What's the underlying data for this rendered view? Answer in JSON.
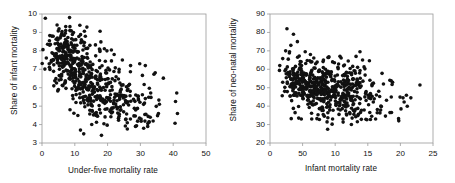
{
  "figure": {
    "background": "#ffffff",
    "point_color": "#111111",
    "axis_color": "#9a9a9a",
    "text_color": "#111111"
  },
  "chart_data": [
    {
      "id": "left",
      "type": "scatter",
      "title": "",
      "xlabel": "Under-five mortality rate",
      "ylabel": "Share of infant mortality",
      "xlim": [
        0,
        50
      ],
      "ylim": [
        3,
        10
      ],
      "xticks": [
        0,
        10,
        20,
        30,
        40,
        50
      ],
      "xticklabels": [
        "0",
        "10",
        "20",
        "30",
        "40",
        "50"
      ],
      "yticks": [
        3,
        4,
        5,
        6,
        7,
        8,
        9,
        10
      ],
      "yticklabels": [
        "3",
        "4",
        "5",
        "6",
        "7",
        "8",
        "9",
        "10"
      ],
      "grid": false,
      "legend": null,
      "marker": {
        "shape": "circle",
        "size_px": 1.8,
        "color": "#111111"
      },
      "n_points": 560,
      "description": "Dense negatively-sloped cloud: share of infant mortality falls from about 9 at low under-five mortality rates to about 4 near rates of 30-35, with scattered outliers out to 41.",
      "generator": {
        "method": "deterministic-lcg",
        "seed": 20240517,
        "clusters": [
          {
            "n": 150,
            "x_mean": 6.5,
            "x_sd": 2.6,
            "y_mean": 7.9,
            "y_sd": 0.75
          },
          {
            "n": 150,
            "x_mean": 11.5,
            "x_sd": 3.6,
            "y_mean": 6.9,
            "y_sd": 0.85
          },
          {
            "n": 130,
            "x_mean": 17.0,
            "x_sd": 4.2,
            "y_mean": 5.9,
            "y_sd": 0.8
          },
          {
            "n": 90,
            "x_mean": 23.0,
            "x_sd": 4.5,
            "y_mean": 5.3,
            "y_sd": 0.75
          },
          {
            "n": 30,
            "x_mean": 30.5,
            "x_sd": 3.2,
            "y_mean": 4.6,
            "y_sd": 0.6
          },
          {
            "n": 10,
            "x_mean": 35.0,
            "x_sd": 3.0,
            "y_mean": 5.2,
            "y_sd": 0.9
          }
        ],
        "outliers": [
          [
            2.2,
            7.3
          ],
          [
            4.6,
            9.4
          ],
          [
            5.2,
            9.2
          ],
          [
            8.5,
            9.1
          ],
          [
            9.6,
            9.0
          ],
          [
            12.0,
            8.6
          ],
          [
            14.6,
            8.3
          ],
          [
            17.5,
            8.1
          ],
          [
            19.8,
            8.0
          ],
          [
            22.0,
            7.8
          ],
          [
            24.5,
            7.5
          ],
          [
            27.0,
            7.2
          ],
          [
            29.8,
            7.3
          ],
          [
            31.5,
            7.2
          ],
          [
            26.0,
            4.1
          ],
          [
            28.5,
            3.9
          ],
          [
            30.2,
            4.3
          ],
          [
            31.0,
            3.8
          ],
          [
            33.0,
            4.4
          ],
          [
            35.5,
            4.6
          ],
          [
            35.8,
            5.1
          ],
          [
            41.3,
            4.6
          ],
          [
            3.0,
            8.8
          ],
          [
            3.6,
            6.1
          ],
          [
            5.0,
            5.9
          ]
        ]
      }
    },
    {
      "id": "right",
      "type": "scatter",
      "title": "",
      "xlabel": "Infant mortality rate",
      "ylabel": "Share of neo-natal mortality",
      "xlim": [
        0,
        25
      ],
      "ylim": [
        20,
        90
      ],
      "xticks": [
        0,
        5,
        10,
        15,
        20,
        25
      ],
      "xticklabels": [
        "0",
        "50",
        "10",
        "15",
        "20",
        "25"
      ],
      "yticks": [
        20,
        30,
        40,
        50,
        60,
        70,
        80,
        90
      ],
      "yticklabels": [
        "20",
        "30",
        "40",
        "50",
        "60",
        "70",
        "80",
        "90"
      ],
      "grid": false,
      "legend": null,
      "marker": {
        "shape": "circle",
        "size_px": 1.8,
        "color": "#111111"
      },
      "n_points": 560,
      "description": "Dense cloud centred near 50 percent neo-natal share, drifting slightly downward as infant mortality rises; a few high outliers near 80 at low rates and sparse points out to 23.",
      "generator": {
        "method": "deterministic-lcg",
        "seed": 777123,
        "clusters": [
          {
            "n": 120,
            "x_mean": 4.0,
            "x_sd": 1.2,
            "y_mean": 53.0,
            "y_sd": 6.5
          },
          {
            "n": 160,
            "x_mean": 7.0,
            "x_sd": 1.6,
            "y_mean": 50.5,
            "y_sd": 7.0
          },
          {
            "n": 150,
            "x_mean": 10.0,
            "x_sd": 1.8,
            "y_mean": 48.5,
            "y_sd": 7.0
          },
          {
            "n": 90,
            "x_mean": 13.0,
            "x_sd": 1.6,
            "y_mean": 47.0,
            "y_sd": 7.5
          },
          {
            "n": 30,
            "x_mean": 16.0,
            "x_sd": 1.3,
            "y_mean": 45.0,
            "y_sd": 6.5
          },
          {
            "n": 10,
            "x_mean": 19.0,
            "x_sd": 1.5,
            "y_mean": 45.0,
            "y_sd": 5.0
          }
        ],
        "outliers": [
          [
            2.6,
            82.0
          ],
          [
            3.6,
            79.0
          ],
          [
            4.2,
            75.0
          ],
          [
            3.2,
            73.0
          ],
          [
            2.4,
            70.0
          ],
          [
            3.0,
            69.5
          ],
          [
            5.4,
            69.5
          ],
          [
            6.2,
            68.0
          ],
          [
            1.5,
            62.0
          ],
          [
            2.8,
            65.5
          ],
          [
            13.8,
            69.5
          ],
          [
            13.2,
            67.0
          ],
          [
            14.2,
            65.0
          ],
          [
            12.0,
            64.5
          ],
          [
            9.6,
            64.0
          ],
          [
            8.2,
            65.0
          ],
          [
            7.0,
            63.0
          ],
          [
            4.4,
            33.5
          ],
          [
            4.8,
            33.0
          ],
          [
            6.4,
            33.0
          ],
          [
            7.2,
            33.2
          ],
          [
            9.6,
            33.0
          ],
          [
            11.2,
            33.0
          ],
          [
            12.6,
            33.5
          ],
          [
            13.4,
            31.5
          ],
          [
            15.6,
            34.5
          ],
          [
            16.2,
            33.0
          ],
          [
            18.4,
            36.5
          ],
          [
            18.6,
            45.0
          ],
          [
            18.8,
            53.0
          ],
          [
            20.4,
            44.5
          ],
          [
            21.6,
            44.5
          ],
          [
            23.0,
            51.5
          ],
          [
            17.0,
            40.0
          ],
          [
            17.4,
            52.0
          ]
        ]
      }
    }
  ]
}
